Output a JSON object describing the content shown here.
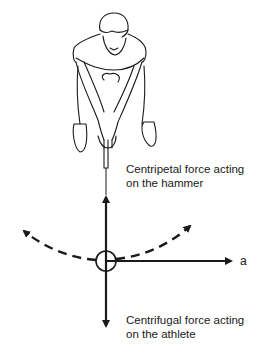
{
  "diagram": {
    "labels": {
      "centripetal_line1": "Centripetal force acting",
      "centripetal_line2": "on the hammer",
      "centrifugal_line1": "Centrifugal force acting",
      "centrifugal_line2": "on the athlete",
      "axis_a": "a"
    },
    "colors": {
      "line": "#1a1a1a",
      "background": "#ffffff"
    }
  }
}
